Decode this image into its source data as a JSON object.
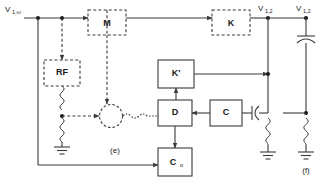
{
  "figure": {
    "type": "block-circuit-diagram",
    "background_color": "#ffffff",
    "line_color": "#3a3a3a"
  },
  "labels": {
    "input_source": "V",
    "input_source_sub": "1,ω",
    "node_v12_a": "V",
    "node_v12_a_sub": "1,2",
    "node_v12_b": "V",
    "node_v12_b_sub": "1,2",
    "panel_e": "(e)",
    "panel_f": "(f)"
  },
  "blocks": [
    {
      "id": "M",
      "label": "M",
      "border": "dashed",
      "x": 88,
      "y": 10,
      "w": 38,
      "h": 25
    },
    {
      "id": "K",
      "label": "K",
      "border": "dashed",
      "x": 212,
      "y": 10,
      "w": 38,
      "h": 25
    },
    {
      "id": "RF",
      "label": "RF",
      "border": "dashed",
      "x": 44,
      "y": 60,
      "w": 36,
      "h": 26
    },
    {
      "id": "Kp",
      "label": "K'",
      "border": "solid",
      "x": 158,
      "y": 60,
      "w": 36,
      "h": 28
    },
    {
      "id": "D",
      "label": "D",
      "border": "solid",
      "x": 158,
      "y": 100,
      "w": 34,
      "h": 26
    },
    {
      "id": "C",
      "label": "C",
      "border": "solid",
      "x": 210,
      "y": 100,
      "w": 32,
      "h": 26
    },
    {
      "id": "C0",
      "label": "C",
      "label_sub": "o",
      "border": "solid",
      "x": 158,
      "y": 148,
      "w": 34,
      "h": 28
    }
  ],
  "components": [
    {
      "id": "capacitor-top-right",
      "type": "capacitor",
      "panel": "f"
    },
    {
      "id": "capacitor-c-right",
      "type": "capacitor",
      "panel": "f"
    },
    {
      "id": "inductor-rf-ground",
      "type": "inductor",
      "panel": "e"
    },
    {
      "id": "inductor-left-f",
      "type": "inductor",
      "panel": "f"
    },
    {
      "id": "inductor-right-f",
      "type": "inductor",
      "panel": "f"
    },
    {
      "id": "mixer",
      "type": "mixer-circle",
      "panel": "e"
    },
    {
      "id": "ground-rf",
      "type": "ground",
      "panel": "e"
    },
    {
      "id": "ground-left-f",
      "type": "ground",
      "panel": "f"
    },
    {
      "id": "ground-right-f",
      "type": "ground",
      "panel": "f"
    }
  ]
}
